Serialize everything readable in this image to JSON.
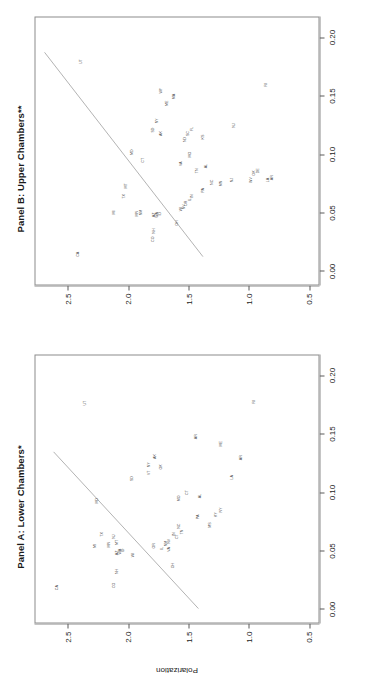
{
  "figure": {
    "ylabel": "Polarization",
    "y_ticks": [
      "0.5",
      "1.0",
      "1.5",
      "2.0",
      "2.5"
    ],
    "x_ticks": [
      "0.00",
      "0.05",
      "0.10",
      "0.15",
      "0.20"
    ]
  },
  "chart_data": [
    {
      "type": "scatter",
      "title": "Panel A: Lower Chambers*",
      "xlabel": "",
      "ylabel": "Polarization",
      "xlim": [
        -0.012,
        0.218
      ],
      "ylim": [
        0.42,
        2.78
      ],
      "grid": false,
      "legend": "none",
      "point_label_mode": "state-abbreviation",
      "fit_line": {
        "type": "linear",
        "x0": 0.0,
        "y0": 1.34,
        "x1": 0.135,
        "y1": 2.62
      },
      "points": [
        {
          "label": "CA",
          "x": 0.018,
          "y": 2.6
        },
        {
          "label": "CO",
          "x": 0.02,
          "y": 2.12
        },
        {
          "label": "NH",
          "x": 0.032,
          "y": 2.1
        },
        {
          "label": "AZ",
          "x": 0.048,
          "y": 2.1
        },
        {
          "label": "WA",
          "x": 0.049,
          "y": 2.07
        },
        {
          "label": "ID",
          "x": 0.05,
          "y": 2.05
        },
        {
          "label": "OH",
          "x": 0.037,
          "y": 1.63
        },
        {
          "label": "MI",
          "x": 0.054,
          "y": 2.28
        },
        {
          "label": "TX",
          "x": 0.064,
          "y": 2.22
        },
        {
          "label": "MN",
          "x": 0.055,
          "y": 2.16
        },
        {
          "label": "MT",
          "x": 0.057,
          "y": 2.1
        },
        {
          "label": "NJ",
          "x": 0.062,
          "y": 2.12
        },
        {
          "label": "WI",
          "x": 0.046,
          "y": 1.96
        },
        {
          "label": "OR",
          "x": 0.054,
          "y": 1.79
        },
        {
          "label": "IL",
          "x": 0.052,
          "y": 1.72
        },
        {
          "label": "NM",
          "x": 0.056,
          "y": 1.69
        },
        {
          "label": "VA",
          "x": 0.051,
          "y": 1.66
        },
        {
          "label": "NV",
          "x": 0.058,
          "y": 1.66
        },
        {
          "label": "CT",
          "x": 0.062,
          "y": 1.6
        },
        {
          "label": "IN",
          "x": 0.064,
          "y": 1.62
        },
        {
          "label": "TN",
          "x": 0.066,
          "y": 1.55
        },
        {
          "label": "NC",
          "x": 0.071,
          "y": 1.58
        },
        {
          "label": "MS",
          "x": 0.072,
          "y": 1.32
        },
        {
          "label": "PA",
          "x": 0.079,
          "y": 1.42
        },
        {
          "label": "KY",
          "x": 0.081,
          "y": 1.27
        },
        {
          "label": "NY",
          "x": 0.085,
          "y": 1.23
        },
        {
          "label": "MD",
          "x": 0.093,
          "y": 2.26
        },
        {
          "label": "MO",
          "x": 0.095,
          "y": 1.58
        },
        {
          "label": "AL",
          "x": 0.097,
          "y": 1.4
        },
        {
          "label": "CT",
          "x": 0.1,
          "y": 1.51
        },
        {
          "label": "SD",
          "x": 0.112,
          "y": 1.97
        },
        {
          "label": "VT",
          "x": 0.117,
          "y": 1.83
        },
        {
          "label": "NY",
          "x": 0.124,
          "y": 1.83
        },
        {
          "label": "OK",
          "x": 0.122,
          "y": 1.73
        },
        {
          "label": "AK",
          "x": 0.131,
          "y": 1.78
        },
        {
          "label": "ME",
          "x": 0.142,
          "y": 1.23
        },
        {
          "label": "LA",
          "x": 0.113,
          "y": 1.14
        },
        {
          "label": "AR",
          "x": 0.13,
          "y": 1.06
        },
        {
          "label": "AR",
          "x": 0.148,
          "y": 1.44
        },
        {
          "label": "UT",
          "x": 0.177,
          "y": 2.36
        },
        {
          "label": "RI",
          "x": 0.178,
          "y": 0.95
        }
      ]
    },
    {
      "type": "scatter",
      "title": "Panel B: Upper Chambers**",
      "xlabel": "",
      "ylabel": "",
      "xlim": [
        -0.012,
        0.218
      ],
      "ylim": [
        0.42,
        2.78
      ],
      "grid": false,
      "legend": "none",
      "point_label_mode": "state-abbreviation",
      "fit_line": {
        "type": "linear",
        "x0": 0.012,
        "y0": 1.3,
        "x1": 0.188,
        "y1": 2.7
      },
      "points": [
        {
          "label": "CA",
          "x": 0.014,
          "y": 2.42
        },
        {
          "label": "CO",
          "x": 0.027,
          "y": 1.8
        },
        {
          "label": "NH",
          "x": 0.034,
          "y": 1.79
        },
        {
          "label": "AZ",
          "x": 0.048,
          "y": 1.79
        },
        {
          "label": "WA",
          "x": 0.048,
          "y": 1.76
        },
        {
          "label": "ID",
          "x": 0.049,
          "y": 1.74
        },
        {
          "label": "OH",
          "x": 0.041,
          "y": 1.6
        },
        {
          "label": "MI",
          "x": 0.05,
          "y": 2.12
        },
        {
          "label": "MN",
          "x": 0.049,
          "y": 1.93
        },
        {
          "label": "NM",
          "x": 0.05,
          "y": 1.9
        },
        {
          "label": "TX",
          "x": 0.064,
          "y": 2.04
        },
        {
          "label": "MT",
          "x": 0.073,
          "y": 2.02
        },
        {
          "label": "WI",
          "x": 0.053,
          "y": 1.56
        },
        {
          "label": "NV",
          "x": 0.055,
          "y": 1.54
        },
        {
          "label": "OR",
          "x": 0.058,
          "y": 1.52
        },
        {
          "label": "IL",
          "x": 0.061,
          "y": 1.49
        },
        {
          "label": "IN",
          "x": 0.064,
          "y": 1.47
        },
        {
          "label": "PA",
          "x": 0.069,
          "y": 1.38
        },
        {
          "label": "NC",
          "x": 0.076,
          "y": 1.3
        },
        {
          "label": "MN",
          "x": 0.075,
          "y": 1.23
        },
        {
          "label": "NJ",
          "x": 0.078,
          "y": 1.14
        },
        {
          "label": "WV",
          "x": 0.078,
          "y": 0.98
        },
        {
          "label": "LA",
          "x": 0.078,
          "y": 0.84
        },
        {
          "label": "AR",
          "x": 0.08,
          "y": 0.8
        },
        {
          "label": "DE",
          "x": 0.086,
          "y": 0.92
        },
        {
          "label": "OK",
          "x": 0.084,
          "y": 0.95
        },
        {
          "label": "TN",
          "x": 0.086,
          "y": 1.43
        },
        {
          "label": "AL",
          "x": 0.09,
          "y": 1.35
        },
        {
          "label": "VA",
          "x": 0.092,
          "y": 1.56
        },
        {
          "label": "CT",
          "x": 0.095,
          "y": 1.88
        },
        {
          "label": "MD",
          "x": 0.102,
          "y": 1.97
        },
        {
          "label": "MO",
          "x": 0.1,
          "y": 1.49
        },
        {
          "label": "ND",
          "x": 0.113,
          "y": 1.53
        },
        {
          "label": "KS",
          "x": 0.115,
          "y": 1.38
        },
        {
          "label": "SC",
          "x": 0.118,
          "y": 1.5
        },
        {
          "label": "FL",
          "x": 0.122,
          "y": 1.47
        },
        {
          "label": "NJ",
          "x": 0.125,
          "y": 1.12
        },
        {
          "label": "AK",
          "x": 0.118,
          "y": 1.73
        },
        {
          "label": "SD",
          "x": 0.121,
          "y": 1.8
        },
        {
          "label": "NY",
          "x": 0.129,
          "y": 1.76
        },
        {
          "label": "ME",
          "x": 0.144,
          "y": 1.68
        },
        {
          "label": "MA",
          "x": 0.15,
          "y": 1.62
        },
        {
          "label": "WY",
          "x": 0.155,
          "y": 1.73
        },
        {
          "label": "RI",
          "x": 0.16,
          "y": 0.85
        },
        {
          "label": "UT",
          "x": 0.18,
          "y": 2.4
        }
      ]
    }
  ]
}
